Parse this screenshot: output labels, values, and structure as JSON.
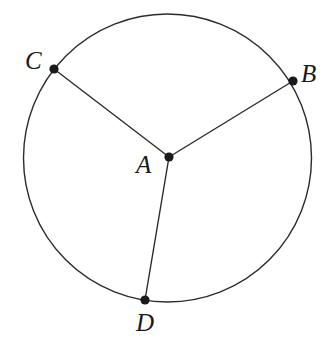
{
  "figure": {
    "kind": "geometry-diagram",
    "background_color": "#ffffff",
    "stroke_color": "#2b2b2b",
    "dot_color": "#1a1a1a",
    "label_color": "#1a1a1a"
  },
  "chart_data": {
    "type": "diagram",
    "title": "",
    "shapes": {
      "circle": {
        "name": "circle",
        "center_x": 167.5,
        "center_y": 158,
        "radius": 144,
        "stroke_width": 1.4
      },
      "segments": [
        {
          "name": "radius-AB",
          "from": "A",
          "to": "B",
          "x1": 169,
          "y1": 157,
          "x2": 293,
          "y2": 81
        },
        {
          "name": "radius-AC",
          "from": "A",
          "to": "C",
          "x1": 169,
          "y1": 157,
          "x2": 54,
          "y2": 69
        },
        {
          "name": "radius-AD",
          "from": "A",
          "to": "D",
          "x1": 169,
          "y1": 157,
          "x2": 145,
          "y2": 300
        }
      ]
    },
    "points": [
      {
        "id": "A",
        "label": "A",
        "x": 169,
        "y": 157,
        "dot_radius": 4.6,
        "role": "center",
        "label_x": 136,
        "label_y": 152
      },
      {
        "id": "B",
        "label": "B",
        "x": 293,
        "y": 81,
        "dot_radius": 4.6,
        "role": "on-circle",
        "label_x": 301,
        "label_y": 61
      },
      {
        "id": "C",
        "label": "C",
        "x": 54,
        "y": 69,
        "dot_radius": 4.6,
        "role": "on-circle",
        "label_x": 25,
        "label_y": 48
      },
      {
        "id": "D",
        "label": "D",
        "x": 145,
        "y": 300,
        "dot_radius": 4.6,
        "role": "on-circle",
        "label_x": 136,
        "label_y": 310
      }
    ],
    "labels": {
      "A": "A",
      "B": "B",
      "C": "C",
      "D": "D"
    }
  }
}
